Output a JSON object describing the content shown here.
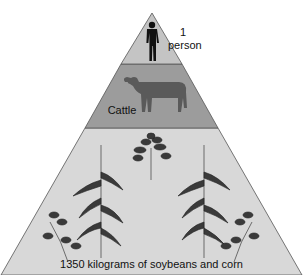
{
  "diagram": {
    "type": "food-energy-pyramid",
    "levels": [
      {
        "name": "top",
        "icon": "person-silhouette",
        "label_line1": "1",
        "label_line2": "person",
        "color": "#c4c4c4"
      },
      {
        "name": "middle",
        "icon": "cow",
        "label": "Cattle",
        "color": "#9c9c9c"
      },
      {
        "name": "bottom",
        "icon": "plants",
        "label": "1350 kilograms of soybeans and corn",
        "color": "#d8d8d8"
      }
    ]
  }
}
